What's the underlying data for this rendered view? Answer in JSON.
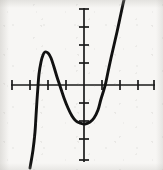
{
  "figure": {
    "kind": "cartesian-plot",
    "width": 163,
    "height": 170,
    "background_color": "#f7f6f4",
    "ink_color": "#111111",
    "axis_color": "#1a1a1a"
  },
  "chart_data": {
    "type": "line",
    "title": "",
    "xlabel": "",
    "ylabel": "",
    "grid": false,
    "legend": null,
    "annotations": [],
    "axes": {
      "x_axis": {
        "pixel_y": 85,
        "pixel_start_x": 11,
        "pixel_end_x": 155,
        "tick_spacing_px": 18,
        "origin_px": 84,
        "range": [
          -4,
          4
        ],
        "tick_values": [
          -4,
          -3,
          -2,
          -1,
          1,
          2,
          3,
          4
        ],
        "tick_labels": [],
        "tick_pixels": [
          12,
          30,
          48,
          66,
          102,
          120,
          138,
          155
        ]
      },
      "y_axis": {
        "pixel_x": 84,
        "pixel_start_y": 8,
        "pixel_end_y": 162,
        "tick_spacing_px": 18,
        "origin_px": 85,
        "range": [
          -4,
          4
        ],
        "tick_values": [
          4,
          3,
          2,
          1,
          -1,
          -2,
          -3,
          -4
        ],
        "tick_labels": [],
        "tick_pixels": [
          9,
          27,
          45,
          63,
          103,
          121,
          139,
          161
        ]
      }
    },
    "series": [
      {
        "name": "cubic-curve",
        "color": "#111111",
        "stroke_width_px": 2.9,
        "x_intercepts_px": [
          38,
          60,
          105
        ],
        "x_intercepts": [
          -2.55,
          -1.33,
          1.17
        ],
        "local_maximum_px": [
          45,
          52
        ],
        "local_maximum": [
          -2.2,
          1.8
        ],
        "local_minimum_px": [
          85,
          124
        ],
        "local_minimum": [
          0.05,
          -2.15
        ],
        "y_intercept_px": [
          84,
          122
        ],
        "end_behavior_left": "falls",
        "end_behavior_right": "rises",
        "path_points_px": [
          [
            30,
            168
          ],
          [
            33,
            150
          ],
          [
            35,
            132
          ],
          [
            36,
            116
          ],
          [
            37,
            100
          ],
          [
            38,
            86
          ],
          [
            39,
            74
          ],
          [
            41,
            62
          ],
          [
            43,
            55
          ],
          [
            45,
            52
          ],
          [
            48,
            53
          ],
          [
            51,
            58
          ],
          [
            54,
            67
          ],
          [
            57,
            77
          ],
          [
            60,
            86
          ],
          [
            64,
            98
          ],
          [
            68,
            108
          ],
          [
            72,
            116
          ],
          [
            76,
            121
          ],
          [
            80,
            123
          ],
          [
            85,
            124
          ],
          [
            90,
            122
          ],
          [
            94,
            118
          ],
          [
            98,
            110
          ],
          [
            101,
            99
          ],
          [
            105,
            86
          ],
          [
            108,
            72
          ],
          [
            111,
            58
          ],
          [
            114,
            45
          ],
          [
            117,
            32
          ],
          [
            120,
            18
          ],
          [
            123,
            4
          ],
          [
            124,
            0
          ]
        ]
      }
    ]
  }
}
